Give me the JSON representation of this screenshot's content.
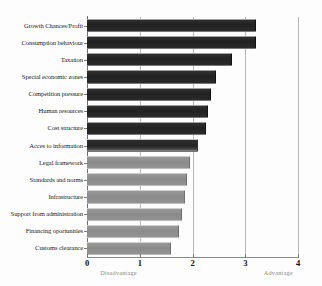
{
  "chart_data": {
    "type": "bar",
    "orientation": "horizontal",
    "title": "",
    "xlabel": "",
    "ylabel": "",
    "xlim": [
      0,
      4
    ],
    "xticks": [
      0,
      1,
      2,
      3,
      4
    ],
    "xtick_labels": [
      "0",
      "1",
      "2",
      "3",
      "4"
    ],
    "grid": true,
    "legend": "none",
    "annotations": [
      {
        "text": "Disadvantage",
        "x": 0.25
      },
      {
        "text": "Advantage",
        "x": 3.35
      }
    ],
    "categories": [
      "Growth Chances/Profit",
      "Consumption behaviour",
      "Taxation",
      "Special economic zones",
      "Competition pressure",
      "Human resources",
      "Cost structure",
      "Acces to information",
      "Legal framework",
      "Standards and norms",
      "Infrastructure",
      "Support from administration",
      "Financing oportunities",
      "Customs clearance"
    ],
    "values": [
      3.2,
      3.2,
      2.75,
      2.45,
      2.35,
      2.3,
      2.25,
      2.1,
      1.95,
      1.9,
      1.85,
      1.8,
      1.75,
      1.6
    ],
    "bar_styles": [
      "dark",
      "dark",
      "dark",
      "dark",
      "dark",
      "dark",
      "dark",
      "fade",
      "light",
      "light",
      "light",
      "light",
      "light",
      "light"
    ],
    "colors": {
      "dark": "#262626",
      "light": "#8f8f8f",
      "grid": "#b9b9b9",
      "axis": "#6e6e6e",
      "label": "#1b1b1b",
      "annotation": "#8a8a8a"
    }
  }
}
